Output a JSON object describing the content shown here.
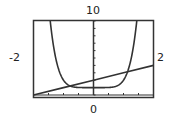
{
  "chart_data": {
    "type": "line",
    "title": "",
    "xlabel": "",
    "ylabel": "",
    "xlim": [
      -2,
      2
    ],
    "ylim": [
      0,
      10
    ],
    "grid": false,
    "legend": null,
    "window_labels": {
      "ymax": "10",
      "xmin": "-2",
      "xmax": "2",
      "ymin_xaxis": "0"
    },
    "x_tick_step": 0.5,
    "y_tick_step": 1,
    "series": [
      {
        "name": "curve",
        "description": "U-shaped curve, approx y = x^6 + 1",
        "x": [
          -1.47,
          -1.25,
          -1.0,
          -0.75,
          -0.5,
          -0.25,
          0,
          0.25,
          0.5,
          0.75,
          1.0,
          1.25,
          1.47
        ],
        "values": [
          10.1,
          4.81,
          2.0,
          1.18,
          1.02,
          1.0,
          1.0,
          1.0,
          1.02,
          1.18,
          2.0,
          4.81,
          10.1
        ]
      },
      {
        "name": "line",
        "description": "straight line, approx y = x + 2",
        "x": [
          -2,
          -1,
          0,
          1,
          2
        ],
        "values": [
          0,
          1,
          2,
          3,
          4
        ]
      }
    ],
    "intersections": [
      {
        "x": -0.78,
        "y": 1.22
      },
      {
        "x": 1.13,
        "y": 3.13
      }
    ]
  },
  "labels": {
    "top": "10",
    "left": "-2",
    "right": "2",
    "bottom": "0"
  },
  "style": {
    "frame_color": "#333333",
    "curve_color": "#333333",
    "background": "#ffffff"
  }
}
